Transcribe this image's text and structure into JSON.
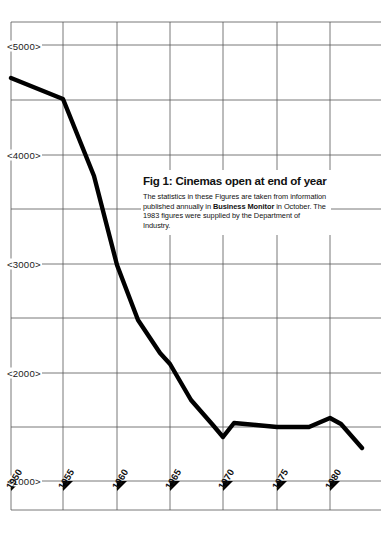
{
  "figure": {
    "title": "Fig 1: Cinemas open at end of year",
    "caption_parts": [
      {
        "text": "The statistics in these Figures are taken from information published annually in ",
        "bold": false
      },
      {
        "text": "Business Monitor",
        "bold": true
      },
      {
        "text": " in October. The 1983 figures were supplied by the Department of Industry.",
        "bold": false
      }
    ],
    "caption_plain": "The statistics in these Figures are taken from information published annually in Business Monitor in October. The 1983 figures were supplied by the Department of Industry."
  },
  "axes": {
    "y_tick_labels": [
      "<5000>",
      "<4000>",
      "<3000>",
      "<2000>",
      "<1000>"
    ],
    "y_tick_values": [
      5000,
      4000,
      3000,
      2000,
      1000
    ],
    "x_tick_labels": [
      "1950",
      "1955",
      "1960",
      "1965",
      "1970",
      "1975",
      "1980"
    ],
    "x_tick_values": [
      1950,
      1955,
      1960,
      1965,
      1970,
      1975,
      1980
    ]
  },
  "colors": {
    "line": "#000000",
    "grid": "#555555",
    "background": "#ffffff",
    "text": "#111111"
  },
  "chart_data": {
    "type": "line",
    "title": "Fig 1: Cinemas open at end of year",
    "subtitle": "The statistics in these Figures are taken from information published annually in Business Monitor in October. The 1983 figures were supplied by the Department of Industry.",
    "xlabel": "",
    "ylabel": "",
    "xlim": [
      1950,
      1983
    ],
    "ylim": [
      600,
      5400
    ],
    "grid": true,
    "legend": false,
    "yticks": [
      1000,
      2000,
      3000,
      4000,
      5000
    ],
    "ytick_labels": [
      "<1000>",
      "<2000>",
      "<3000>",
      "<4000>",
      "<5000>"
    ],
    "xticks": [
      1950,
      1955,
      1960,
      1965,
      1970,
      1975,
      1980
    ],
    "xtick_labels": [
      "1950",
      "1955",
      "1960",
      "1965",
      "1970",
      "1975",
      "1980"
    ],
    "series": [
      {
        "name": "Cinemas open at end of year",
        "x": [
          1950,
          1955,
          1958,
          1960,
          1962,
          1964,
          1965,
          1967,
          1969,
          1970,
          1971,
          1973,
          1975,
          1978,
          1980,
          1981,
          1983
        ],
        "values": [
          4700,
          4500,
          3800,
          2950,
          2350,
          2050,
          1950,
          1800,
          1620,
          1450,
          1580,
          1570,
          1540,
          1540,
          1620,
          1590,
          1330
        ]
      }
    ]
  }
}
